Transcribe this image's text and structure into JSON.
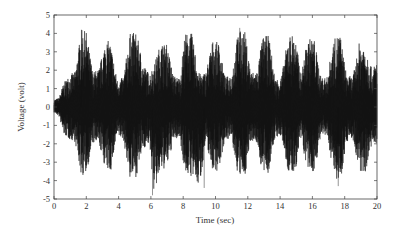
{
  "chart_data": {
    "type": "line",
    "title": "",
    "xlabel": "Time (sec)",
    "ylabel": "Voltage (volt)",
    "xlim": [
      0,
      20
    ],
    "ylim": [
      -5,
      5
    ],
    "xticks": [
      0,
      2,
      4,
      6,
      8,
      10,
      12,
      14,
      16,
      18,
      20
    ],
    "yticks": [
      -5,
      -4,
      -3,
      -2,
      -1,
      0,
      1,
      2,
      3,
      4,
      5
    ],
    "grid": false,
    "legend": null,
    "line_color": "#111111",
    "envelope": {
      "t": [
        0.0,
        0.3,
        0.6,
        1.0,
        1.3,
        1.7,
        2.0,
        2.4,
        2.8,
        3.2,
        3.5,
        3.9,
        4.3,
        4.7,
        5.1,
        5.5,
        5.9,
        6.2,
        6.6,
        7.0,
        7.4,
        7.8,
        8.1,
        8.5,
        9.0,
        9.4,
        9.8,
        10.2,
        10.6,
        11.0,
        11.4,
        11.8,
        12.2,
        12.6,
        12.9,
        13.3,
        13.7,
        14.1,
        14.5,
        14.9,
        15.3,
        15.7,
        16.1,
        16.5,
        16.9,
        17.3,
        17.7,
        18.1,
        18.5,
        18.9,
        19.3,
        19.7,
        20.0
      ],
      "upper": [
        0.4,
        0.5,
        1.3,
        1.8,
        1.9,
        4.2,
        4.1,
        1.9,
        2.1,
        3.7,
        3.5,
        1.5,
        1.6,
        4.0,
        4.1,
        2.4,
        1.8,
        2.3,
        3.5,
        3.4,
        1.7,
        1.6,
        4.0,
        4.1,
        1.8,
        1.9,
        3.6,
        3.5,
        1.6,
        1.8,
        4.1,
        4.2,
        1.9,
        2.0,
        3.8,
        3.9,
        1.5,
        1.7,
        3.9,
        4.0,
        1.8,
        3.7,
        3.8,
        1.7,
        1.6,
        3.6,
        4.1,
        1.8,
        1.6,
        3.5,
        3.4,
        2.0,
        2.6
      ],
      "lower": [
        -0.3,
        -0.5,
        -1.5,
        -1.8,
        -1.9,
        -3.8,
        -3.6,
        -2.0,
        -2.1,
        -3.4,
        -3.6,
        -1.6,
        -1.8,
        -3.9,
        -3.8,
        -2.3,
        -2.0,
        -4.8,
        -3.5,
        -3.3,
        -1.8,
        -1.7,
        -3.6,
        -3.8,
        -4.4,
        -1.9,
        -3.4,
        -3.5,
        -1.7,
        -1.8,
        -3.8,
        -3.9,
        -1.8,
        -2.0,
        -3.7,
        -3.6,
        -1.6,
        -1.7,
        -3.6,
        -3.7,
        -1.8,
        -3.5,
        -3.6,
        -1.7,
        -1.6,
        -3.5,
        -4.3,
        -1.9,
        -1.7,
        -3.7,
        -3.5,
        -2.0,
        -2.4
      ]
    },
    "notable_extrema": [
      {
        "t": 1.7,
        "v": 4.2
      },
      {
        "t": 6.1,
        "v": -4.8
      },
      {
        "t": 9.3,
        "v": -4.4
      },
      {
        "t": 11.5,
        "v": 4.3
      },
      {
        "t": 17.6,
        "v": -4.3
      }
    ]
  },
  "axes": {
    "x_tick_labels": [
      "0",
      "2",
      "4",
      "6",
      "8",
      "10",
      "12",
      "14",
      "16",
      "18",
      "20"
    ],
    "y_tick_labels": [
      "5",
      "4",
      "3",
      "2",
      "1",
      "0",
      "-1",
      "-2",
      "-3",
      "-4",
      "-5"
    ]
  }
}
